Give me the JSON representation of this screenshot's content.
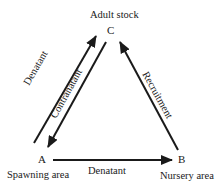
{
  "nodes": {
    "c": {
      "letter": "C",
      "name": "Adult stock"
    },
    "a": {
      "letter": "A",
      "name": "Spawning area"
    },
    "b": {
      "letter": "B",
      "name": "Nursery area"
    }
  },
  "edges": {
    "a_to_c": "Denatant",
    "c_to_a": "Contranatant",
    "a_to_b": "Denatant",
    "b_to_c": "Recruitment"
  },
  "colors": {
    "ink": "#1a1a1a",
    "background": "#ffffff"
  }
}
